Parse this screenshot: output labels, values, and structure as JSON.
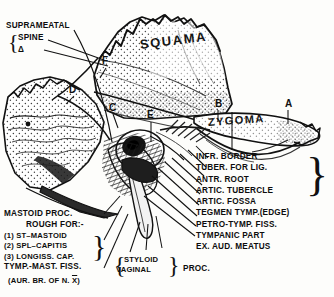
{
  "figure": {
    "background_color": "#fdfdfb",
    "ink_color": "#111111"
  },
  "regions": {
    "squama": "SQUAMA",
    "zygoma": "ZYGOMA"
  },
  "supra_label": {
    "heading": "SUPRAMEATAL",
    "items": [
      "SPINE",
      "Δ"
    ],
    "brace": "{"
  },
  "letters": [
    {
      "id": "A",
      "text": "A",
      "x": 285,
      "y": 101
    },
    {
      "id": "B",
      "text": "B",
      "x": 215,
      "y": 101
    },
    {
      "id": "C",
      "text": "C",
      "x": 110,
      "y": 105
    },
    {
      "id": "D",
      "text": "D",
      "x": 70,
      "y": 88
    },
    {
      "id": "E",
      "text": "E",
      "x": 148,
      "y": 113
    },
    {
      "id": "F",
      "text": "F",
      "x": 103,
      "y": 58
    }
  ],
  "right_labels": [
    "INFR. BORDER",
    "TUBER. FOR LIG.",
    "ANTR. ROOT",
    "ARTIC. TUBERCLE",
    "ARTIC. FOSSA",
    "TEGMEN TYMP.(EDGE)",
    "PETRO-TYMP. FISS.",
    "TYMPANIC  PART",
    "EX. AUD. MEATUS"
  ],
  "right_brace": "}",
  "left_block": {
    "line1": "MASTOID PROC.",
    "line2": "ROUGH FOR:-",
    "items": [
      "(1) ST–MASTOID",
      "(2) SPL–CAPITIS",
      "(3) LONGISS. CAP."
    ],
    "brace": "}",
    "line3": "TYMP.-MAST. FISS.",
    "line4_pre": "(AUR. BR. OF N. ",
    "line4_sym": "X",
    "line4_post": ")"
  },
  "center_block": {
    "brace_left": "{",
    "items": [
      "STYLOID",
      "VAGINAL"
    ],
    "brace_right": "}",
    "proc": "PROC."
  }
}
